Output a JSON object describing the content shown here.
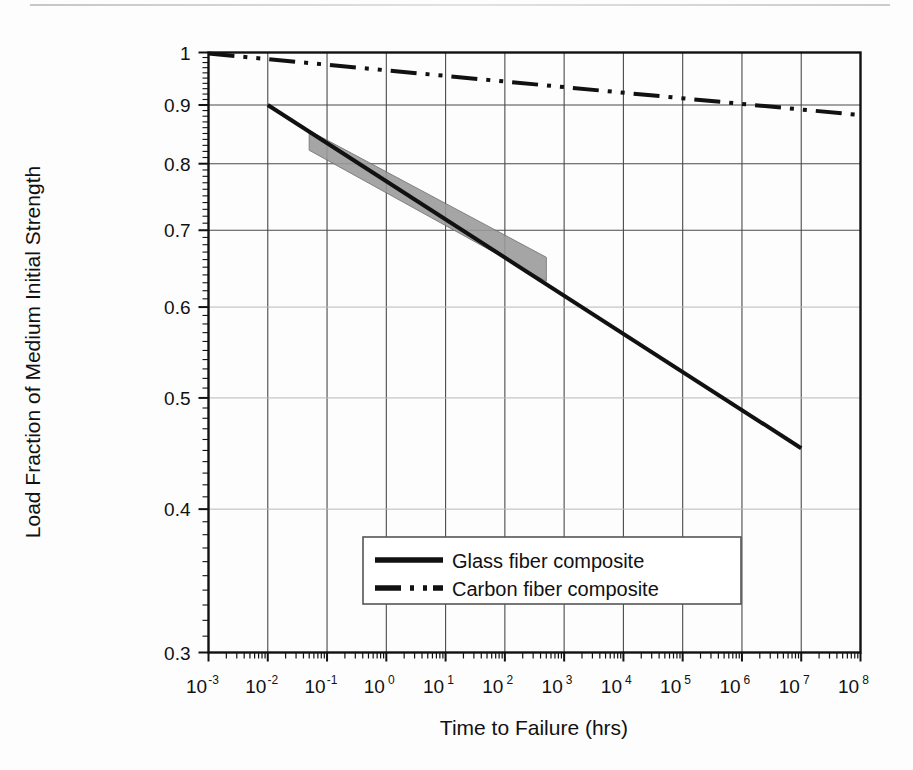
{
  "chart_data": {
    "type": "line",
    "title": "",
    "xlabel": "Time to Failure (hrs)",
    "ylabel": "Load Fraction of Medium Initial Strength",
    "xscale": "log",
    "yscale": "log",
    "xlim": [
      0.001,
      100000000
    ],
    "ylim": [
      0.3,
      1.0
    ],
    "grid": true,
    "legend_position": "lower-center-inside",
    "x_tick_labels": [
      "10-3",
      "10-2",
      "10-1",
      "100",
      "101",
      "102",
      "103",
      "104",
      "105",
      "106",
      "107",
      "108"
    ],
    "x_tick_bases": [
      "10",
      "10",
      "10",
      "10",
      "10",
      "10",
      "10",
      "10",
      "10",
      "10",
      "10",
      "10"
    ],
    "x_tick_exponents": [
      "-3",
      "-2",
      "-1",
      "0",
      "1",
      "2",
      "3",
      "4",
      "5",
      "6",
      "7",
      "8"
    ],
    "x_tick_values": [
      0.001,
      0.01,
      0.1,
      1,
      10,
      100,
      1000,
      10000,
      100000,
      1000000,
      10000000,
      100000000
    ],
    "y_tick_labels": [
      "0.3",
      "0.4",
      "0.5",
      "0.6",
      "0.7",
      "0.8",
      "0.9",
      "1"
    ],
    "y_tick_values": [
      0.3,
      0.4,
      0.5,
      0.6,
      0.7,
      0.8,
      0.9,
      1.0
    ],
    "series": [
      {
        "name": "Glass fiber composite",
        "style": "solid",
        "color": "#111111",
        "linewidth": 4,
        "x": [
          0.01,
          10000000
        ],
        "y": [
          0.9,
          0.452
        ],
        "description": "Straight line on log-log axes from (1e-2, 0.90) to (1e7, 0.452)"
      },
      {
        "name": "Carbon fiber composite",
        "style": "dash-dot",
        "color": "#111111",
        "linewidth": 4,
        "x": [
          0.001,
          100000000
        ],
        "y": [
          0.998,
          0.882
        ],
        "description": "Straight line on log-log axes from (1e-3, 0.998) to (1e8, 0.882)"
      }
    ],
    "shaded_band": {
      "name": "Experimental scatter band",
      "color": "#9a9a9a",
      "x_range": [
        0.05,
        500
      ],
      "y_upper": [
        0.855,
        0.663
      ],
      "y_lower": [
        0.822,
        0.632
      ],
      "description": "Gray parallelogram band straddling the glass fiber line between about 1e-1.3 and 5e2 hours"
    },
    "legend": [
      {
        "label": "Glass fiber composite",
        "style": "solid"
      },
      {
        "label": "Carbon fiber composite",
        "style": "dash-dot"
      }
    ]
  }
}
